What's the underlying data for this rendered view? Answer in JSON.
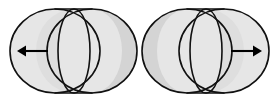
{
  "canvas": {
    "width": 279,
    "height": 101,
    "background_color": "#ffffff"
  },
  "figure": {
    "title": "",
    "kind": "line-drawing",
    "stroke_color": "#111111",
    "shade_color": "#e6e6e6",
    "shade_color_dark": "#d4d4d4",
    "arrow_color": "#000000",
    "stroke_width": 1.6
  },
  "figures": [
    {
      "id": "left-cylinder",
      "name": "cylinder-pointing-left",
      "arrow_direction": "left",
      "arrow_label": "",
      "shading_side": "right",
      "near_rim_side": "left",
      "geometry": {
        "left_circle_cx": 55,
        "left_circle_cy": 51,
        "right_circle_cx": 92,
        "right_circle_cy": 51,
        "circle_rx": 45,
        "circle_ry": 42,
        "inner_ellipse_cx": 74,
        "inner_ellipse_cy": 51,
        "inner_ellipse_rx": 16,
        "inner_ellipse_ry": 42
      },
      "arrow": {
        "x1": 48,
        "y1": 51,
        "x2": 17,
        "y2": 51,
        "head_size": 9
      }
    },
    {
      "id": "right-cylinder",
      "name": "cylinder-pointing-right",
      "arrow_direction": "right",
      "arrow_label": "",
      "shading_side": "left",
      "near_rim_side": "right",
      "geometry": {
        "left_circle_cx": 187,
        "left_circle_cy": 51,
        "right_circle_cx": 224,
        "right_circle_cy": 51,
        "circle_rx": 45,
        "circle_ry": 42,
        "inner_ellipse_cx": 206,
        "inner_ellipse_cy": 51,
        "inner_ellipse_rx": 16,
        "inner_ellipse_ry": 42
      },
      "arrow": {
        "x1": 231,
        "y1": 51,
        "x2": 262,
        "y2": 51,
        "head_size": 9
      }
    }
  ]
}
